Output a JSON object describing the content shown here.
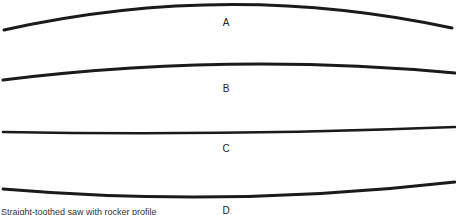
{
  "figure": {
    "type": "diagram",
    "ink_color": "#1a1a1a",
    "profiles": [
      {
        "label": "A",
        "shape": "strongly convex (arched)",
        "path": "M4,30 Q228,-20 452,28",
        "label_x": 226,
        "label_y": 18
      },
      {
        "label": "B",
        "shape": "slightly convex",
        "path": "M3,80 Q228,52 455,73",
        "label_x": 226,
        "label_y": 84
      },
      {
        "label": "C",
        "shape": "straight",
        "path": "M3,132 Q228,136 455,127",
        "label_x": 226,
        "label_y": 144
      },
      {
        "label": "D",
        "shape": "slightly concave (sagging)",
        "path": "M3,189 Q228,208 455,182",
        "label_x": 226,
        "label_y": 206
      }
    ]
  },
  "caption": "Straight-toothed saw with rocker profile"
}
